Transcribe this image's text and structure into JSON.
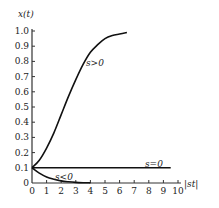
{
  "chart_data": {
    "type": "line",
    "title": "",
    "xlabel": "|st|",
    "ylabel": "x(t)",
    "xlim": [
      0,
      10
    ],
    "ylim": [
      0,
      1.0
    ],
    "x_ticks": [
      "0",
      "1",
      "2",
      "3",
      "4",
      "5",
      "6",
      "7",
      "8",
      "9",
      "10"
    ],
    "y_ticks": [
      "0",
      "0.1",
      "0.2",
      "0.3",
      "0.4",
      "0.5",
      "0.6",
      "0.7",
      "0.8",
      "0.9",
      "1.0"
    ],
    "grid": false,
    "legend": "none (inline curve labels)",
    "series": [
      {
        "name": "s>0",
        "x": [
          0,
          0.5,
          1,
          1.5,
          2,
          2.5,
          3,
          3.5,
          4,
          4.5,
          5,
          5.5,
          6,
          6.5
        ],
        "values": [
          0.1,
          0.15,
          0.23,
          0.33,
          0.45,
          0.57,
          0.68,
          0.78,
          0.86,
          0.91,
          0.95,
          0.97,
          0.98,
          0.99
        ]
      },
      {
        "name": "s=0",
        "x": [
          0,
          9.5
        ],
        "values": [
          0.1,
          0.1
        ]
      },
      {
        "name": "s<0",
        "x": [
          0,
          0.5,
          1,
          1.5,
          2,
          2.5,
          3,
          3.5,
          4
        ],
        "values": [
          0.1,
          0.065,
          0.04,
          0.025,
          0.014,
          0.008,
          0.004,
          0.002,
          0.001
        ]
      }
    ],
    "annotations": [
      {
        "text": "s>0",
        "x": 4.2,
        "y": 0.8
      },
      {
        "text": "s=0",
        "x": 7.8,
        "y": 0.12
      },
      {
        "text": "s<0",
        "x": 1.6,
        "y": 0.03
      }
    ]
  },
  "axis": {
    "y_label": "x(t)",
    "x_label": "|st|"
  },
  "labels": {
    "pos": "s>0",
    "zero": "s=0",
    "neg": "s<0"
  }
}
